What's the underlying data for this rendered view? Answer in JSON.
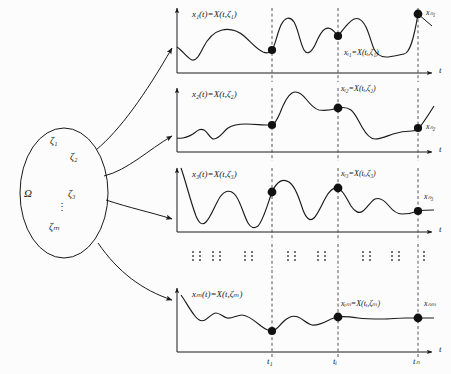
{
  "figure": {
    "type": "stochastic-process-ensemble-diagram",
    "sample_space": {
      "symbol": "Ω",
      "outcomes": [
        "ζ₁",
        "ζ₂",
        "ζ₃",
        "⋮",
        "ζₘ"
      ]
    },
    "axis_label_t": "t",
    "time_ticks": [
      "t₁",
      "tᵢ",
      "tₙ"
    ],
    "vertical_ellipsis": "⋮",
    "panels": [
      {
        "id": "panel-1",
        "function_label": "x₁(t)=X(t,ζ₁)",
        "mid_sample_label": "xᵢ₁=X(tᵢ,ζ₁)",
        "end_sample_label": "xₙ₁"
      },
      {
        "id": "panel-2",
        "function_label": "x₂(t)=X(t,ζ₂)",
        "mid_sample_label": "xᵢ₂=X(tᵢ,ζ₂)",
        "end_sample_label": "xₙ₂"
      },
      {
        "id": "panel-3",
        "function_label": "x₃(t)=X(t,ζ₃)",
        "mid_sample_label": "xᵢ₃=X(tᵢ,ζ₃)",
        "end_sample_label": "xₙ₃"
      },
      {
        "id": "panel-m",
        "function_label": "xₘ(t)=X(t,ζₘ)",
        "mid_sample_label": "xᵢₘ=X(tᵢ,ζₘ)",
        "end_sample_label": "xₙₘ"
      }
    ],
    "colors": {
      "ink": "#1a1a1a",
      "dashed": "#444444",
      "background": "#fcfcfc"
    }
  }
}
